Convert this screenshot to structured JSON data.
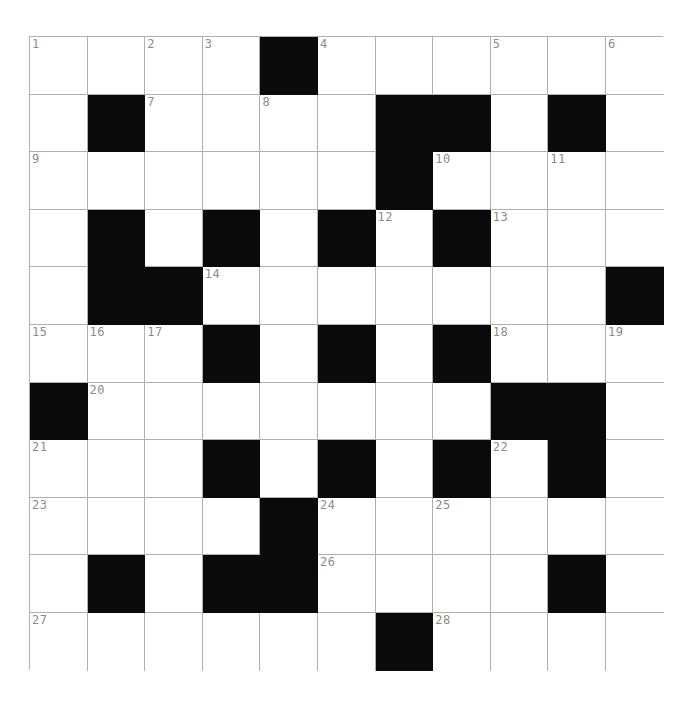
{
  "puzzle": {
    "kind": "crossword-grid",
    "title": "",
    "rows": 11,
    "cols": 11,
    "cell_size_px": 57.6,
    "colors": {
      "background": "#ffffff",
      "block_fill": "#0a0a0a",
      "cell_fill": "#ffffff",
      "grid_line": "#b0b0b0",
      "number_text": "#8c8c8c"
    },
    "block_cells": [
      [
        0,
        4
      ],
      [
        1,
        1
      ],
      [
        1,
        6
      ],
      [
        1,
        7
      ],
      [
        1,
        9
      ],
      [
        2,
        6
      ],
      [
        3,
        1
      ],
      [
        3,
        3
      ],
      [
        3,
        5
      ],
      [
        3,
        7
      ],
      [
        4,
        1
      ],
      [
        4,
        2
      ],
      [
        4,
        10
      ],
      [
        5,
        3
      ],
      [
        5,
        5
      ],
      [
        5,
        7
      ],
      [
        6,
        0
      ],
      [
        6,
        8
      ],
      [
        6,
        9
      ],
      [
        7,
        3
      ],
      [
        7,
        5
      ],
      [
        7,
        7
      ],
      [
        7,
        9
      ],
      [
        8,
        4
      ],
      [
        9,
        1
      ],
      [
        9,
        3
      ],
      [
        9,
        4
      ],
      [
        9,
        9
      ],
      [
        10,
        6
      ]
    ],
    "numbers": [
      {
        "n": "1",
        "row": 0,
        "col": 0
      },
      {
        "n": "2",
        "row": 0,
        "col": 2
      },
      {
        "n": "3",
        "row": 0,
        "col": 3
      },
      {
        "n": "4",
        "row": 0,
        "col": 5
      },
      {
        "n": "5",
        "row": 0,
        "col": 8
      },
      {
        "n": "6",
        "row": 0,
        "col": 10
      },
      {
        "n": "7",
        "row": 1,
        "col": 2
      },
      {
        "n": "8",
        "row": 1,
        "col": 4
      },
      {
        "n": "9",
        "row": 2,
        "col": 0
      },
      {
        "n": "10",
        "row": 2,
        "col": 7
      },
      {
        "n": "11",
        "row": 2,
        "col": 9
      },
      {
        "n": "12",
        "row": 3,
        "col": 6
      },
      {
        "n": "13",
        "row": 3,
        "col": 8
      },
      {
        "n": "14",
        "row": 4,
        "col": 3
      },
      {
        "n": "15",
        "row": 5,
        "col": 0
      },
      {
        "n": "16",
        "row": 5,
        "col": 1
      },
      {
        "n": "17",
        "row": 5,
        "col": 2
      },
      {
        "n": "18",
        "row": 5,
        "col": 8
      },
      {
        "n": "19",
        "row": 5,
        "col": 10
      },
      {
        "n": "20",
        "row": 6,
        "col": 1
      },
      {
        "n": "21",
        "row": 7,
        "col": 0
      },
      {
        "n": "22",
        "row": 7,
        "col": 8
      },
      {
        "n": "23",
        "row": 8,
        "col": 0
      },
      {
        "n": "24",
        "row": 8,
        "col": 5
      },
      {
        "n": "25",
        "row": 8,
        "col": 7
      },
      {
        "n": "26",
        "row": 9,
        "col": 5
      },
      {
        "n": "27",
        "row": 10,
        "col": 0
      },
      {
        "n": "28",
        "row": 10,
        "col": 7
      }
    ],
    "entries": []
  }
}
